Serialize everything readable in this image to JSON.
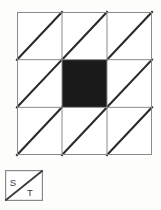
{
  "figure": {
    "type": "quilt-block-pattern",
    "title": "",
    "background_color": "#fdfdfc"
  },
  "grid": {
    "rows": 3,
    "columns": 3,
    "cell_count": 9,
    "outline_color": "#8a8a8a",
    "diagonal_color": "#2b2b2b",
    "fill_empty_color": "#ffffff",
    "fill_solid_color": "#1a1a1a",
    "diagonal_direction": "bottom-left-to-top-right",
    "cells": [
      {
        "row": 0,
        "col": 0,
        "style": "diagonal",
        "label": "cell-r0-c0"
      },
      {
        "row": 0,
        "col": 1,
        "style": "diagonal",
        "label": "cell-r0-c1"
      },
      {
        "row": 0,
        "col": 2,
        "style": "diagonal",
        "label": "cell-r0-c2"
      },
      {
        "row": 1,
        "col": 0,
        "style": "diagonal",
        "label": "cell-r1-c0"
      },
      {
        "row": 1,
        "col": 1,
        "style": "solid",
        "label": "cell-r1-c1"
      },
      {
        "row": 1,
        "col": 2,
        "style": "diagonal",
        "label": "cell-r1-c2"
      },
      {
        "row": 2,
        "col": 0,
        "style": "diagonal",
        "label": "cell-r2-c0"
      },
      {
        "row": 2,
        "col": 1,
        "style": "diagonal",
        "label": "cell-r2-c1"
      },
      {
        "row": 2,
        "col": 2,
        "style": "diagonal",
        "label": "cell-r2-c2"
      }
    ]
  },
  "legend": {
    "outline_color": "#8a8a8a",
    "diagonal_color": "#3a3a3a",
    "upper_label": "S",
    "lower_label": "T"
  }
}
